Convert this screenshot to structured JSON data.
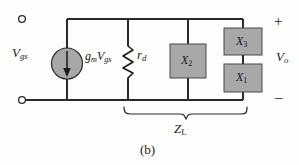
{
  "figure": {
    "caption": "(b)",
    "background_color": "#fdfdfb",
    "line_color": "#2a2a2a",
    "component_fill": "#a8a8a8"
  },
  "terminals": {
    "input_label": "V",
    "input_sub": "gs",
    "output_label": "V",
    "output_sub": "o",
    "polarity_plus": "+",
    "polarity_minus": "–"
  },
  "components": {
    "current_source": {
      "icon": "dependent-current-source-icon",
      "label_main": "g",
      "label_main_sub": "m",
      "label_second": "V",
      "label_second_sub": "gs",
      "arrow_direction": "down",
      "fill": "#a8a8a8"
    },
    "resistor": {
      "icon": "resistor-zigzag-icon",
      "label": "r",
      "label_sub": "d"
    },
    "reactance_x2": {
      "icon": "impedance-box-icon",
      "label": "X",
      "label_sub": "2",
      "fill": "#a8a8a8"
    },
    "reactance_x3": {
      "icon": "impedance-box-icon",
      "label": "X",
      "label_sub": "3",
      "fill": "#a8a8a8"
    },
    "reactance_x1": {
      "icon": "impedance-box-icon",
      "label": "X",
      "label_sub": "1",
      "fill": "#a8a8a8"
    }
  },
  "annotations": {
    "load_brace_label": "Z",
    "load_brace_sub": "L"
  }
}
